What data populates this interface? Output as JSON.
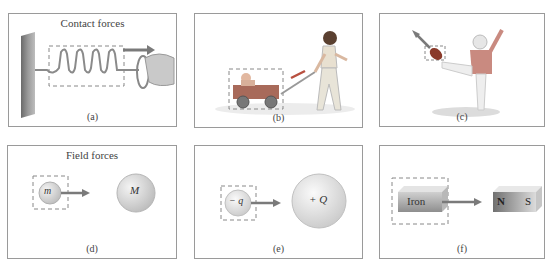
{
  "figure": {
    "rows": [
      {
        "title": "Contact forces",
        "panels": [
          {
            "id": "a",
            "caption": "(a)",
            "description": "Hand pulling a spring attached to a wall; spring enclosed in dashed box; arrow pointing right"
          },
          {
            "id": "b",
            "caption": "(b)",
            "description": "Child pulling a wagon with a baby inside; wagon enclosed in dashed box; arrow along handle"
          },
          {
            "id": "c",
            "caption": "(c)",
            "description": "Football player kicking a ball; ball enclosed in dashed box; arrow pointing up-left"
          }
        ]
      },
      {
        "title": "Field forces",
        "panels": [
          {
            "id": "d",
            "caption": "(d)",
            "small_label": "m",
            "large_label": "M",
            "description": "Small mass m in dashed box attracted toward large mass M"
          },
          {
            "id": "e",
            "caption": "(e)",
            "small_label": "− q",
            "large_label": "+ Q",
            "description": "Negative charge -q in dashed box attracted toward positive charge +Q"
          },
          {
            "id": "f",
            "caption": "(f)",
            "small_label": "Iron",
            "magnet_n": "N",
            "magnet_s": "S",
            "description": "Iron block in dashed box attracted toward bar magnet N S"
          }
        ]
      }
    ],
    "colors": {
      "border": "#9a9a9a",
      "arrow": "#7a7a7a",
      "dashed": "#888888",
      "sphere": "#d8d8d8",
      "player": "#c98a80",
      "ball": "#8a3a2a"
    }
  }
}
